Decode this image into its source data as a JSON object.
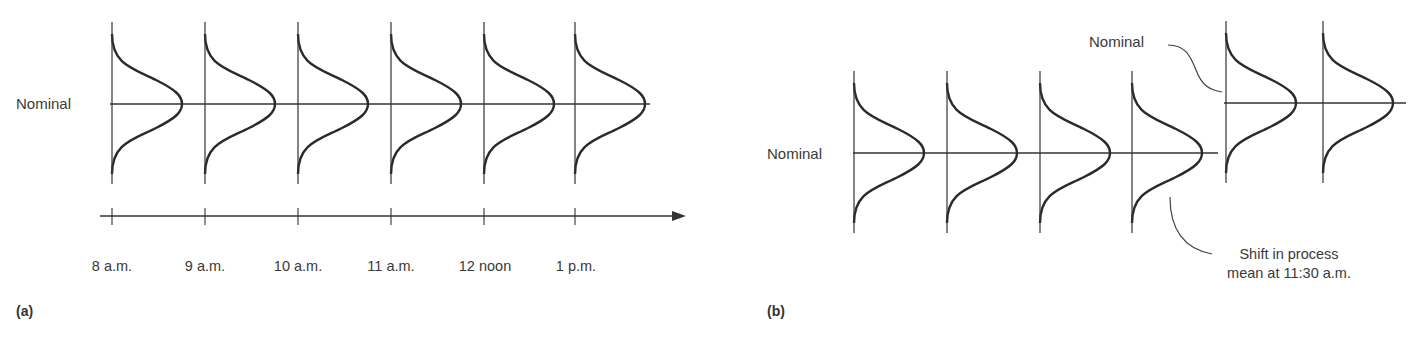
{
  "panel_a": {
    "label": "(a)",
    "nominal_label": "Nominal",
    "time_axis": {
      "ticks": [
        "8 a.m.",
        "9 a.m.",
        "10 a.m.",
        "11 a.m.",
        "12 noon",
        "1 p.m."
      ],
      "arrow": true
    },
    "distributions": [
      {
        "time": "8 a.m.",
        "mean": "Nominal"
      },
      {
        "time": "9 a.m.",
        "mean": "Nominal"
      },
      {
        "time": "10 a.m.",
        "mean": "Nominal"
      },
      {
        "time": "11 a.m.",
        "mean": "Nominal"
      },
      {
        "time": "12 noon",
        "mean": "Nominal"
      },
      {
        "time": "1 p.m.",
        "mean": "Nominal"
      }
    ]
  },
  "panel_b": {
    "label": "(b)",
    "nominal_label_lower": "Nominal",
    "nominal_label_upper": "Nominal",
    "annotation": {
      "line1": "Shift in process",
      "line2": "mean at 11:30 a.m."
    },
    "distributions_before_shift": 4,
    "distributions_after_shift": 2
  },
  "colors": {
    "stroke": "#2a2a2a",
    "text": "#3a3a3a",
    "background": "#ffffff"
  }
}
